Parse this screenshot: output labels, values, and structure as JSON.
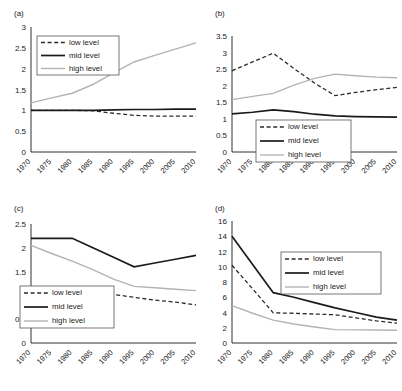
{
  "figure": {
    "panel_tags": [
      "(a)",
      "(b)",
      "(c)",
      "(d)"
    ],
    "legend_labels": [
      "low level",
      "mid level",
      "high level"
    ],
    "colors": {
      "low": "#2b2b2b",
      "mid": "#1a1a1a",
      "high": "#b3b3b3",
      "axis": "#1a1a1a",
      "background": "#ffffff"
    }
  },
  "chart_data": [
    {
      "type": "line",
      "title": "(a)",
      "xlabel": "",
      "ylabel": "",
      "x": [
        1970,
        1975,
        1980,
        1985,
        1990,
        1995,
        2000,
        2005,
        2010
      ],
      "xtick_labels": [
        "1970",
        "1975",
        "1980",
        "1985",
        "1990",
        "1995",
        "2000",
        "2005",
        "2010"
      ],
      "ytick_labels": [
        "0",
        "0.5",
        "1",
        "1.5",
        "2",
        "2.5",
        "3"
      ],
      "yticks": [
        0,
        0.5,
        1,
        1.5,
        2,
        2.5,
        3
      ],
      "ylim": [
        0,
        3
      ],
      "grid": false,
      "legend_position": "upper-left",
      "series": [
        {
          "name": "low level",
          "values": [
            1.0,
            1.0,
            1.0,
            0.99,
            0.93,
            0.88,
            0.86,
            0.86,
            0.86
          ]
        },
        {
          "name": "mid level",
          "values": [
            1.0,
            1.0,
            1.0,
            1.0,
            1.01,
            1.02,
            1.02,
            1.03,
            1.03
          ]
        },
        {
          "name": "high level",
          "values": [
            1.18,
            1.3,
            1.41,
            1.62,
            1.9,
            2.16,
            2.32,
            2.47,
            2.62
          ]
        }
      ]
    },
    {
      "type": "line",
      "title": "(b)",
      "xlabel": "",
      "ylabel": "",
      "x": [
        1970,
        1975,
        1980,
        1985,
        1990,
        1995,
        2000,
        2005,
        2010
      ],
      "xtick_labels": [
        "1970",
        "1975",
        "1980",
        "1985",
        "1990",
        "1995",
        "2000",
        "2005",
        "2010"
      ],
      "ytick_labels": [
        "0",
        "0.5",
        "1",
        "1.5",
        "2",
        "2.5",
        "3",
        "3.5"
      ],
      "yticks": [
        0,
        0.5,
        1,
        1.5,
        2,
        2.5,
        3,
        3.5
      ],
      "ylim": [
        0,
        3.5
      ],
      "grid": false,
      "legend_position": "lower-right",
      "series": [
        {
          "name": "low level",
          "values": [
            2.45,
            2.72,
            2.98,
            2.52,
            2.08,
            1.7,
            1.8,
            1.88,
            1.95
          ]
        },
        {
          "name": "mid level",
          "values": [
            1.15,
            1.2,
            1.27,
            1.22,
            1.14,
            1.09,
            1.07,
            1.06,
            1.05
          ]
        },
        {
          "name": "high level",
          "values": [
            1.58,
            1.68,
            1.77,
            2.02,
            2.22,
            2.35,
            2.3,
            2.26,
            2.24
          ]
        }
      ]
    },
    {
      "type": "line",
      "title": "(c)",
      "xlabel": "",
      "ylabel": "",
      "x": [
        1970,
        1975,
        1980,
        1985,
        1990,
        1995,
        2000,
        2005,
        2010
      ],
      "xtick_labels": [
        "1970",
        "1975",
        "1980",
        "1985",
        "1990",
        "1995",
        "2000",
        "2005",
        "2010"
      ],
      "ytick_labels": [
        "0",
        "0.5",
        "1",
        "1.5",
        "2",
        "2.5"
      ],
      "yticks": [
        0,
        0.5,
        1,
        1.5,
        2,
        2.5
      ],
      "ylim": [
        0,
        2.5
      ],
      "grid": false,
      "legend_position": "lower-left",
      "series": [
        {
          "name": "low level",
          "values": [
            1.05,
            1.1,
            1.13,
            1.1,
            1.02,
            0.96,
            0.9,
            0.86,
            0.8
          ]
        },
        {
          "name": "mid level",
          "values": [
            2.2,
            2.2,
            2.2,
            2.0,
            1.8,
            1.6,
            1.68,
            1.76,
            1.84
          ]
        },
        {
          "name": "high level",
          "values": [
            2.05,
            1.88,
            1.72,
            1.54,
            1.34,
            1.19,
            1.16,
            1.13,
            1.1
          ]
        }
      ]
    },
    {
      "type": "line",
      "title": "(d)",
      "xlabel": "",
      "ylabel": "",
      "x": [
        1970,
        1975,
        1980,
        1985,
        1990,
        1995,
        2000,
        2005,
        2010
      ],
      "xtick_labels": [
        "1970",
        "1975",
        "1980",
        "1985",
        "1990",
        "1995",
        "2000",
        "2005",
        "2010"
      ],
      "ytick_labels": [
        "0",
        "2",
        "4",
        "6",
        "8",
        "10",
        "12",
        "14",
        "16"
      ],
      "yticks": [
        0,
        2,
        4,
        6,
        8,
        10,
        12,
        14,
        16
      ],
      "ylim": [
        0,
        16
      ],
      "grid": false,
      "legend_position": "upper-right",
      "series": [
        {
          "name": "low level",
          "values": [
            10.2,
            7.1,
            3.95,
            3.9,
            3.8,
            3.7,
            3.3,
            2.9,
            2.6
          ]
        },
        {
          "name": "mid level",
          "values": [
            14.0,
            10.3,
            6.6,
            6.0,
            5.3,
            4.6,
            4.0,
            3.4,
            3.0
          ]
        },
        {
          "name": "high level",
          "values": [
            4.9,
            3.9,
            3.0,
            2.5,
            2.1,
            1.75,
            1.72,
            1.7,
            1.68
          ]
        }
      ]
    }
  ]
}
